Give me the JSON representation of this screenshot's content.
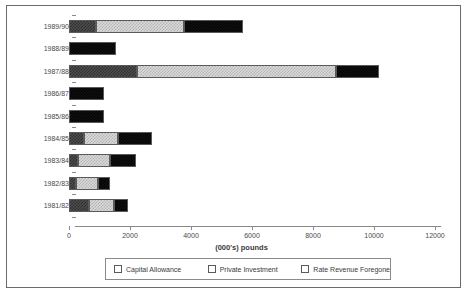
{
  "chart_data": {
    "type": "bar",
    "orientation": "horizontal",
    "stacked": true,
    "title": "",
    "xlabel": "(000's) pounds",
    "ylabel": "",
    "xlim": [
      0,
      12000
    ],
    "xticks": [
      0,
      2000,
      4000,
      6000,
      8000,
      10000,
      12000
    ],
    "xtick_labels": [
      "0",
      "2000",
      "4000",
      "6000",
      "8000",
      "10000",
      "12000"
    ],
    "grid": false,
    "legend_position": "bottom",
    "categories": [
      "1989/90",
      "1988/89",
      "1987/88",
      "1986/87",
      "1985/86",
      "1984/85",
      "1983/84",
      "1982/83",
      "1981/82"
    ],
    "series": [
      {
        "name": "Capital Allowance",
        "color": "#4d4d4d",
        "values": [
          885,
          0,
          2230,
          0,
          0,
          500,
          300,
          230,
          660
        ]
      },
      {
        "name": "Private Investment",
        "color": "#d9d9d9",
        "values": [
          2885,
          0,
          6530,
          0,
          0,
          1115,
          1050,
          720,
          820
        ]
      },
      {
        "name": "Rate Revenue Foregone",
        "color": "#111111",
        "values": [
          1935,
          1540,
          1410,
          1150,
          1150,
          1115,
          855,
          395,
          460
        ]
      }
    ],
    "totals": [
      5705,
      1540,
      10170,
      1150,
      1150,
      2730,
      2205,
      1345,
      1940
    ]
  },
  "legend": {
    "items": [
      {
        "label": "Capital Allowance",
        "swatch": "capital-allowance-swatch"
      },
      {
        "label": "Private Investment",
        "swatch": "private-investment-swatch"
      },
      {
        "label": "Rate Revenue Foregone",
        "swatch": "rate-revenue-foregone-swatch"
      }
    ]
  }
}
